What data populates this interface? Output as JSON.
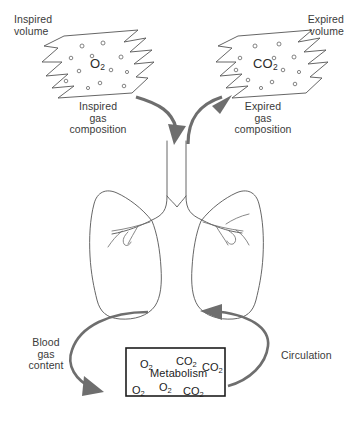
{
  "diagram": {
    "background_color": "#ffffff",
    "outline_color": "#555555",
    "arrow_color": "#6e6e6e",
    "text_color": "#3a3a3a",
    "box_border_color": "#1d1d1d"
  },
  "labels": {
    "inspired_volume": "Inspired\nvolume",
    "expired_volume": "Expired\nvolume",
    "inspired_gas_composition": "Inspired\ngas\ncomposition",
    "expired_gas_composition": "Expired\ngas\ncomposition",
    "blood_gas_content": "Blood\ngas\ncontent",
    "circulation": "Circulation",
    "metabolism": "Metabolism"
  },
  "gas_tags": {
    "inspired_cloud": {
      "formula": "O",
      "subscript": "2"
    },
    "expired_cloud": {
      "formula": "CO",
      "subscript": "2"
    }
  },
  "metabolism_box": {
    "molecules": [
      {
        "formula": "O",
        "subscript": "2",
        "x": 14,
        "y": 10
      },
      {
        "formula": "CO",
        "subscript": "2",
        "x": 50,
        "y": 7
      },
      {
        "formula": "CO",
        "subscript": "2",
        "x": 76,
        "y": 13
      },
      {
        "formula": "O",
        "subscript": "2",
        "x": 6,
        "y": 36
      },
      {
        "formula": "O",
        "subscript": "2",
        "x": 33,
        "y": 33
      },
      {
        "formula": "CO",
        "subscript": "2",
        "x": 57,
        "y": 37
      }
    ]
  },
  "clouds": {
    "inspired": {
      "bubbles": [
        {
          "cx": 82,
          "cy": 46,
          "r": 2.0
        },
        {
          "cx": 103,
          "cy": 43,
          "r": 2.0
        },
        {
          "cx": 71,
          "cy": 58,
          "r": 1.8
        },
        {
          "cx": 92,
          "cy": 56,
          "r": 1.8
        },
        {
          "cx": 121,
          "cy": 57,
          "r": 2.0
        },
        {
          "cx": 79,
          "cy": 71,
          "r": 1.8
        },
        {
          "cx": 111,
          "cy": 70,
          "r": 1.8
        },
        {
          "cx": 127,
          "cy": 72,
          "r": 1.6
        },
        {
          "cx": 66,
          "cy": 81,
          "r": 1.8
        },
        {
          "cx": 100,
          "cy": 83,
          "r": 1.8
        },
        {
          "cx": 124,
          "cy": 86,
          "r": 1.8
        },
        {
          "cx": 88,
          "cy": 88,
          "r": 1.6
        }
      ]
    },
    "expired": {
      "bubbles": [
        {
          "cx": 255,
          "cy": 46,
          "r": 2.0
        },
        {
          "cx": 279,
          "cy": 44,
          "r": 2.0
        },
        {
          "cx": 240,
          "cy": 58,
          "r": 1.8
        },
        {
          "cx": 274,
          "cy": 58,
          "r": 1.8
        },
        {
          "cx": 294,
          "cy": 57,
          "r": 2.0
        },
        {
          "cx": 236,
          "cy": 70,
          "r": 1.8
        },
        {
          "cx": 283,
          "cy": 70,
          "r": 1.8
        },
        {
          "cx": 299,
          "cy": 72,
          "r": 1.6
        },
        {
          "cx": 248,
          "cy": 80,
          "r": 1.8
        },
        {
          "cx": 272,
          "cy": 82,
          "r": 1.8
        },
        {
          "cx": 295,
          "cy": 84,
          "r": 1.8
        },
        {
          "cx": 261,
          "cy": 88,
          "r": 1.6
        }
      ]
    }
  }
}
